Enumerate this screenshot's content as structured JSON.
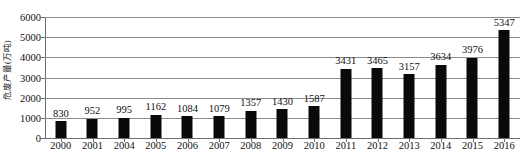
{
  "chart_data": {
    "type": "bar",
    "title": "",
    "xlabel": "",
    "ylabel": "危废产量(万吨)",
    "ylim": [
      0,
      6000
    ],
    "ytick_step": 1000,
    "yticks": [
      0,
      1000,
      2000,
      3000,
      4000,
      5000,
      6000
    ],
    "ytick_labels": [
      "0",
      "1000",
      "2000",
      "3000",
      "4000",
      "5000",
      "6000"
    ],
    "grid": true,
    "legend": null,
    "legend_position": "none",
    "bar_color": "#0a0a0a",
    "gridline_color": "#8c8c8c",
    "show_data_labels": true,
    "categories": [
      "2000",
      "2001",
      "2004",
      "2005",
      "2006",
      "2007",
      "2008",
      "2009",
      "2010",
      "2011",
      "2012",
      "2013",
      "2014",
      "2015",
      "2016"
    ],
    "values": [
      830,
      952,
      995,
      1162,
      1084,
      1079,
      1357,
      1430,
      1587,
      3431,
      3465,
      3157,
      3634,
      3976,
      5347
    ],
    "data_labels": [
      "830",
      "952",
      "995",
      "1162",
      "1084",
      "1079",
      "1357",
      "1430",
      "1587",
      "3431",
      "3465",
      "3157",
      "3634",
      "3976",
      "5347"
    ]
  },
  "caption": {
    "text": ""
  }
}
